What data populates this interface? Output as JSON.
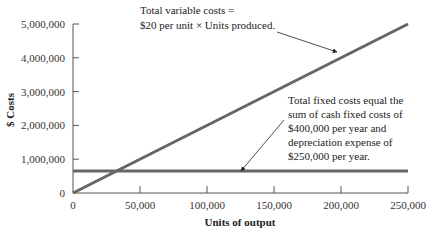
{
  "chart_data": {
    "type": "line",
    "title": "",
    "xlabel": "Units of output",
    "ylabel": "$ Costs",
    "xlim": [
      0,
      250000
    ],
    "ylim": [
      0,
      5000000
    ],
    "grid": false,
    "x_ticks": [
      "0",
      "50,000",
      "100,000",
      "150,000",
      "200,000",
      "250,000"
    ],
    "y_ticks": [
      "0",
      "1,000,000",
      "2,000,000",
      "3,000,000",
      "4,000,000",
      "5,000,000"
    ],
    "series": [
      {
        "name": "Total variable costs",
        "x": [
          0,
          250000
        ],
        "values": [
          0,
          5000000
        ],
        "color": "#666666"
      },
      {
        "name": "Total fixed costs",
        "x": [
          0,
          250000
        ],
        "values": [
          650000,
          650000
        ],
        "color": "#666666"
      }
    ],
    "annotations": [
      {
        "id": "variable",
        "lines": [
          "Total variable costs =",
          "$20 per unit × Units produced."
        ]
      },
      {
        "id": "fixed",
        "lines": [
          "Total fixed costs equal the",
          "sum of cash fixed costs of",
          "$400,000 per year and",
          "depreciation expense of",
          "$250,000 per year."
        ]
      }
    ]
  }
}
